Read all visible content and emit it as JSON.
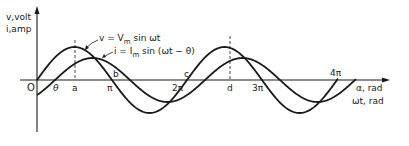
{
  "diagram": {
    "y_axis_label_line1": "v,volt",
    "y_axis_label_line2": "i,amp",
    "x_axis_label_line1": "α, rad",
    "x_axis_label_line2": "ωt, rad",
    "origin_label": "O",
    "voltage_equation": "v = V",
    "voltage_sub": "m",
    "voltage_tail": " sin ωt",
    "current_equation": "i = I",
    "current_sub": "m",
    "current_tail": " sin (ωt − θ)",
    "points": {
      "theta": "θ",
      "a": "a",
      "b": "b",
      "c": "c",
      "d": "d"
    },
    "ticks": {
      "pi": "π",
      "two_pi": "2π",
      "three_pi": "3π",
      "four_pi": "4π"
    },
    "colors": {
      "ink": "#1a1a1a",
      "background": "#ffffff"
    }
  }
}
